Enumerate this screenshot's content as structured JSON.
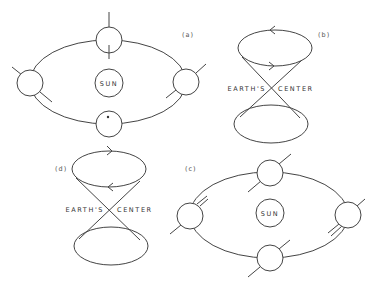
{
  "figure": {
    "panels": [
      {
        "id": "a",
        "tag": "(a)",
        "type": "orbit",
        "sun_label": "SUN",
        "description": "Earth orbiting Sun; rotation axis fixed vertical (perpendicular to orbital plane) at top/bottom, tilted at sides"
      },
      {
        "id": "b",
        "tag": "(b)",
        "type": "precession-cone",
        "center_label_left": "EARTH'S",
        "center_label_right": "CENTER",
        "top_arrow": "left",
        "bottom_arrow": "right"
      },
      {
        "id": "c",
        "tag": "(c)",
        "type": "orbit",
        "sun_label": "SUN",
        "description": "Earth orbiting Sun; rotation axis maintains constant tilt direction"
      },
      {
        "id": "d",
        "tag": "(d)",
        "type": "precession-cone",
        "center_label_left": "EARTH'S",
        "center_label_right": "CENTER",
        "top_arrow": "right",
        "bottom_arrow": "left"
      }
    ],
    "colors": {
      "line": "#444444",
      "background": "#ffffff",
      "text": "#333333"
    }
  }
}
